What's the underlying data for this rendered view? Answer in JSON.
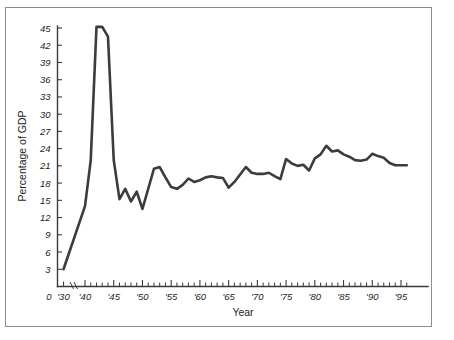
{
  "figure": {
    "background_color": "#ffffff",
    "border_color": "#8d8d8d",
    "line_color": "#3c3c3c",
    "text_color": "#1d1d1d"
  },
  "chart_data": {
    "type": "line",
    "title": "",
    "xlabel": "Year",
    "ylabel": "Percentage of GDP",
    "xlim": [
      1930,
      1997
    ],
    "ylim": [
      0,
      46
    ],
    "grid": false,
    "legend": null,
    "axis_break": {
      "present": true,
      "between": [
        "'30",
        "'40"
      ],
      "style": "double-slash"
    },
    "y_ticks": [
      0,
      3,
      6,
      9,
      12,
      15,
      18,
      21,
      24,
      27,
      30,
      33,
      36,
      39,
      42,
      45
    ],
    "y_tick_labels": [
      "0",
      "3",
      "6",
      "9",
      "12",
      "15",
      "18",
      "21",
      "24",
      "27",
      "30",
      "33",
      "36",
      "39",
      "42",
      "45"
    ],
    "x_ticks": [
      1930,
      1940,
      1945,
      1950,
      1955,
      1960,
      1965,
      1970,
      1975,
      1980,
      1985,
      1990,
      1995
    ],
    "x_tick_labels": [
      "'30",
      "'40",
      "'45",
      "'50",
      "'55",
      "'60",
      "'65",
      "'70",
      "'75",
      "'80",
      "'85",
      "'90",
      "'95"
    ],
    "x_minor_tick_interval": 1,
    "series": [
      {
        "name": "Federal outlays as percentage of GDP",
        "x": [
          1930,
          1940,
          1941,
          1942,
          1943,
          1944,
          1945,
          1946,
          1947,
          1948,
          1949,
          1950,
          1951,
          1952,
          1953,
          1954,
          1955,
          1956,
          1957,
          1958,
          1959,
          1960,
          1961,
          1962,
          1963,
          1964,
          1965,
          1966,
          1967,
          1968,
          1969,
          1970,
          1971,
          1972,
          1973,
          1974,
          1975,
          1976,
          1977,
          1978,
          1979,
          1980,
          1981,
          1982,
          1983,
          1984,
          1985,
          1986,
          1987,
          1988,
          1989,
          1990,
          1991,
          1992,
          1993,
          1994,
          1995,
          1996
        ],
        "values": [
          3.0,
          14.0,
          22.0,
          45.2,
          45.2,
          43.5,
          22.0,
          15.2,
          17.0,
          14.8,
          16.5,
          13.5,
          17.0,
          20.5,
          20.8,
          19.0,
          17.3,
          17.0,
          17.7,
          18.8,
          18.2,
          18.5,
          19.0,
          19.2,
          19.0,
          18.9,
          17.2,
          18.2,
          19.5,
          20.8,
          19.8,
          19.6,
          19.6,
          19.8,
          19.2,
          18.7,
          22.2,
          21.4,
          21.0,
          21.2,
          20.2,
          22.3,
          23.0,
          24.5,
          23.5,
          23.7,
          23.0,
          22.6,
          22.0,
          21.9,
          22.1,
          23.1,
          22.7,
          22.4,
          21.5,
          21.1,
          21.1,
          21.1
        ]
      }
    ],
    "annotations": []
  },
  "axis_titles": {
    "x": "Year",
    "y": "Percentage of GDP"
  }
}
